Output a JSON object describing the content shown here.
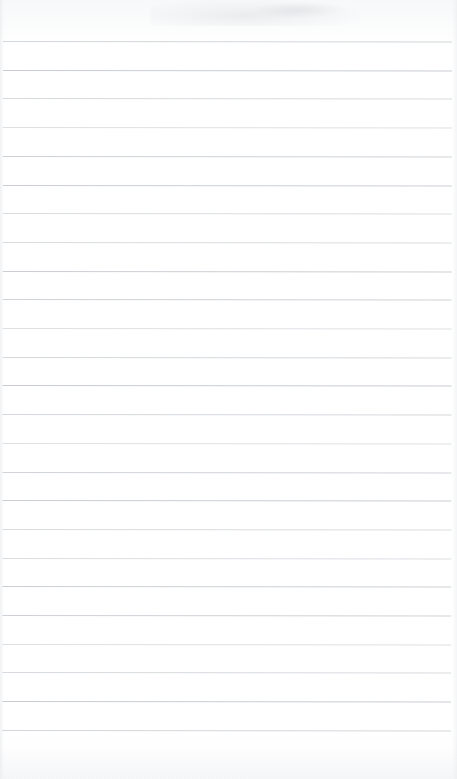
{
  "document": {
    "type": "scanned-lined-paper",
    "title": "Blank ruled notebook page",
    "page_width": 457,
    "page_height": 779,
    "background_color": "#fdfdfd",
    "rule_color": "#c9cdd2",
    "rule_thickness": 1,
    "rule_left_x": 3,
    "rule_right_x": 452,
    "first_rule_y": 41,
    "rule_spacing": 28.7,
    "rule_count": 25,
    "top_margin_text": "",
    "body_text": "",
    "footer_text": "",
    "has_vertical_margin_rule": false,
    "artifacts": [
      {
        "name": "top-smudge",
        "x": 150,
        "y": 0,
        "width": 210,
        "height": 26
      },
      {
        "name": "top-smudge-secondary",
        "x": 252,
        "y": 2,
        "width": 92,
        "height": 16
      }
    ],
    "rule_y_positions": [
      41,
      69.7,
      98.4,
      127.1,
      155.8,
      184.5,
      213.2,
      241.9,
      270.6,
      299.3,
      328,
      356.7,
      385.4,
      414.1,
      442.8,
      471.5,
      500.2,
      528.9,
      557.6,
      586.3,
      615,
      643.7,
      672.4,
      701.1,
      729.8
    ]
  }
}
